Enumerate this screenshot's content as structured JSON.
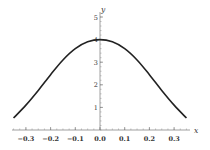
{
  "chart_data": {
    "type": "line",
    "title": "",
    "xlabel": "x",
    "ylabel": "y",
    "xlim": [
      -0.35,
      0.35
    ],
    "ylim": [
      0,
      5
    ],
    "xticks": [
      "-0.3",
      "-0.2",
      "-0.1",
      "0.0",
      "0.1",
      "0.2",
      "0.3"
    ],
    "yticks": [
      "1",
      "2",
      "3",
      "4",
      "5"
    ],
    "grid": false,
    "series": [
      {
        "name": "y(x)",
        "x": [
          -0.35,
          -0.3,
          -0.25,
          -0.2,
          -0.15,
          -0.1,
          -0.05,
          0.0,
          0.05,
          0.1,
          0.15,
          0.2,
          0.25,
          0.3,
          0.35
        ],
        "values": [
          0.53,
          1.1,
          1.75,
          2.45,
          3.1,
          3.6,
          3.9,
          4.0,
          3.9,
          3.6,
          3.1,
          2.45,
          1.75,
          1.1,
          0.53
        ]
      }
    ]
  }
}
